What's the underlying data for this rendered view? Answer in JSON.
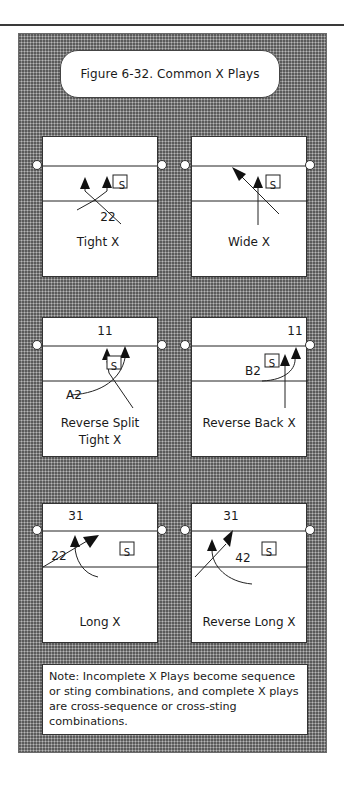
{
  "figure": {
    "title": "Figure 6-32. Common X Plays",
    "note": "Note: Incomplete X Plays  become sequence or sting combinations, and complete X plays are cross-sequence or cross-sting combinations.",
    "setter_marker": "S",
    "colors": {
      "panel_background": "#8a8a8a",
      "box_background": "#ffffff",
      "line": "#222222"
    }
  },
  "plays": [
    {
      "name": "Tight X",
      "labels": [
        "22"
      ]
    },
    {
      "name": "Wide X",
      "labels": []
    },
    {
      "name_line1": "Reverse Split",
      "name_line2": "Tight X",
      "labels": [
        "11",
        "A2"
      ]
    },
    {
      "name": "Reverse Back X",
      "labels": [
        "11",
        "B2"
      ]
    },
    {
      "name": "Long X",
      "labels": [
        "31",
        "22"
      ]
    },
    {
      "name": "Reverse Long X",
      "labels": [
        "31",
        "42"
      ]
    }
  ]
}
